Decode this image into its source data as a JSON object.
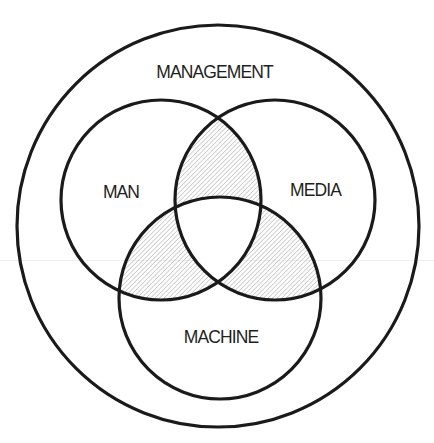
{
  "diagram": {
    "type": "nested-venn",
    "outer_set": {
      "label": "MANAGEMENT",
      "cx": 218,
      "cy": 226,
      "r": 201
    },
    "sets": [
      {
        "id": "man",
        "label": "MAN",
        "cx": 161,
        "cy": 200,
        "r": 100
      },
      {
        "id": "media",
        "label": "MEDIA",
        "cx": 275,
        "cy": 200,
        "r": 100
      },
      {
        "id": "machine",
        "label": "MACHINE",
        "cx": 220,
        "cy": 298,
        "r": 101
      }
    ],
    "hatched_regions": [
      "MAN ∩ MEDIA (excluding MACHINE)",
      "MAN ∩ MACHINE (excluding MEDIA)",
      "MEDIA ∩ MACHINE (excluding MAN)"
    ],
    "colors": {
      "stroke": "#1a1a1a",
      "hatch": "#9a9a9a",
      "text": "#1f1f1f",
      "background": "#ffffff"
    }
  }
}
